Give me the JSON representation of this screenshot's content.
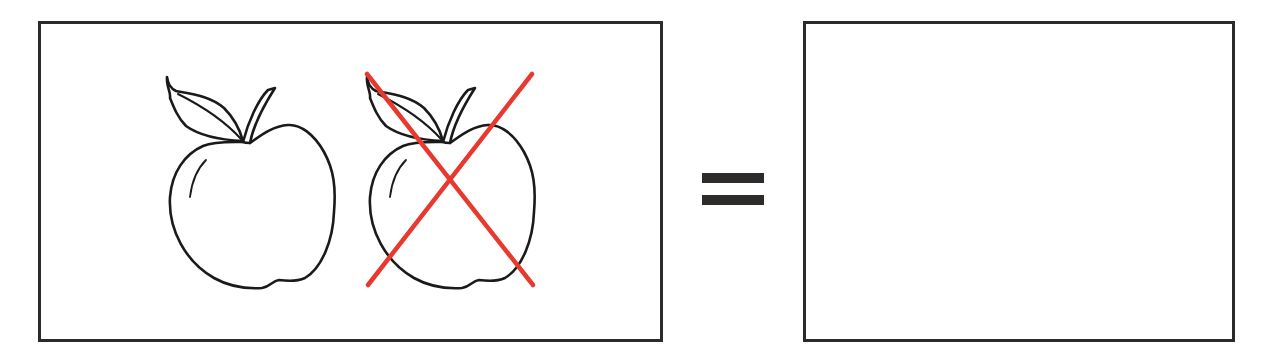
{
  "diagram": {
    "type": "visual-equation",
    "left_panel": {
      "items": [
        {
          "object": "apple",
          "state": "present",
          "label": "apple"
        },
        {
          "object": "apple",
          "state": "crossed-out",
          "label": "apple (crossed out)"
        }
      ]
    },
    "operator": {
      "symbol": "=",
      "label": "equals"
    },
    "right_panel": {
      "items": [],
      "label": "empty answer box"
    }
  },
  "colors": {
    "outline": "#1a1a1a",
    "cross": "#e8392f",
    "border": "#2b2b2b",
    "background": "#ffffff"
  }
}
